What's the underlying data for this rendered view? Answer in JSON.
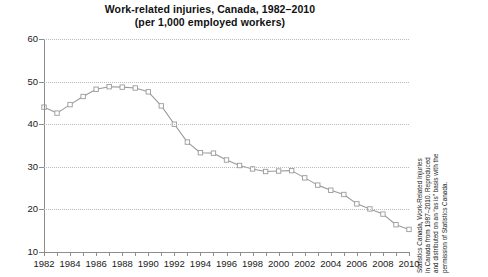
{
  "chart_data": {
    "type": "line",
    "title": "Work-related injuries, Canada, 1982–2010",
    "subtitle": "(per 1,000 employed workers)",
    "xlabel": "",
    "ylabel": "",
    "ylim": [
      10,
      60
    ],
    "xlim": [
      1982,
      2010
    ],
    "yticks": [
      10,
      20,
      30,
      40,
      50,
      60
    ],
    "grid": true,
    "legend": false,
    "marker": "open-square",
    "series_color": "#9a9a9a",
    "grid_color": "#b9b9c2",
    "axis_color": "#8d8d8d",
    "x": [
      1982,
      1983,
      1984,
      1985,
      1986,
      1987,
      1988,
      1989,
      1990,
      1991,
      1992,
      1993,
      1994,
      1995,
      1996,
      1997,
      1998,
      1999,
      2000,
      2001,
      2002,
      2003,
      2004,
      2005,
      2006,
      2007,
      2008,
      2009,
      2010
    ],
    "values": [
      44.0,
      42.6,
      44.6,
      46.5,
      48.2,
      48.8,
      48.7,
      48.5,
      47.6,
      44.3,
      40.0,
      35.8,
      33.3,
      33.2,
      31.6,
      30.3,
      29.5,
      28.9,
      29.0,
      29.1,
      27.4,
      25.7,
      24.5,
      23.5,
      21.3,
      20.1,
      18.9,
      16.4,
      15.3
    ],
    "xtick_labels": [
      "1982",
      "1984",
      "1986",
      "1988",
      "1990",
      "1992",
      "1994",
      "1996",
      "1998",
      "2000",
      "2002",
      "2004",
      "2006",
      "2008",
      "2010"
    ],
    "xtick_values": [
      1982,
      1984,
      1986,
      1988,
      1990,
      1992,
      1994,
      1996,
      1998,
      2000,
      2002,
      2004,
      2006,
      2008,
      2010
    ]
  },
  "source_note": {
    "lines": [
      "Statistics Canada, Work-Related Injuries",
      "in Canada from 1987–2010. Reproduced",
      "and distributed on an “as is” basis with the",
      "permission of Statistics Canada."
    ]
  }
}
